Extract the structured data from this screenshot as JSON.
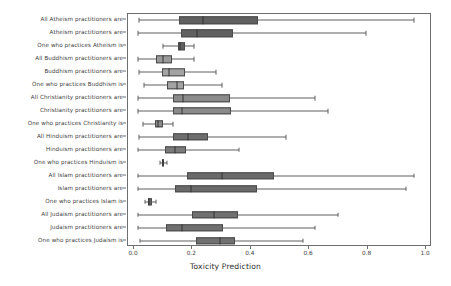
{
  "chart_data": {
    "type": "boxplot",
    "title": "",
    "xlabel": "Toxicity Prediction",
    "ylabel": "",
    "xlim": [
      0.0,
      1.0
    ],
    "ylim": [
      0,
      15
    ],
    "grid": false,
    "legend": null,
    "orientation": "horizontal",
    "xticks": [
      "0.0",
      "0.2",
      "0.4",
      "0.6",
      "0.8",
      "1.0"
    ],
    "xtick_values": [
      0.0,
      0.2,
      0.4,
      0.6,
      0.8,
      1.0
    ],
    "categories": [
      "All Atheism practitioners are",
      "Atheism practitioners are",
      "One who practices Atheism is",
      "All Buddhism practitioners are",
      "Buddhism practitioners are",
      "One who practices Buddhism is",
      "All Christianity practitioners are",
      "Christianity practitioners are",
      "One who practices Christianity is",
      "All Hinduism practitioners are",
      "Hinduism practitioners are",
      "One who practices Hinduism is",
      "All Islam practitioners are",
      "Islam practitioners are",
      "One who practices Islam is",
      "All Judaism practitioners are",
      "Judaism practitioners are",
      "One who practices Judaism is"
    ],
    "boxes": [
      {
        "label": "All Atheism practitioners are",
        "whisker_low": 0.018,
        "q1": 0.155,
        "median": 0.235,
        "q3": 0.425,
        "whisker_high": 0.96,
        "fill": "#606060"
      },
      {
        "label": "Atheism practitioners are",
        "whisker_low": 0.015,
        "q1": 0.16,
        "median": 0.215,
        "q3": 0.34,
        "whisker_high": 0.795,
        "fill": "#606060"
      },
      {
        "label": "One who practices Atheism is",
        "whisker_low": 0.1,
        "q1": 0.15,
        "median": 0.158,
        "q3": 0.175,
        "whisker_high": 0.205,
        "fill": "#606060"
      },
      {
        "label": "All Buddhism practitioners are",
        "whisker_low": 0.015,
        "q1": 0.075,
        "median": 0.098,
        "q3": 0.13,
        "whisker_high": 0.205,
        "fill": "#9a9a9a"
      },
      {
        "label": "Buddhism practitioners are",
        "whisker_low": 0.018,
        "q1": 0.095,
        "median": 0.12,
        "q3": 0.175,
        "whisker_high": 0.28,
        "fill": "#a3a3a3"
      },
      {
        "label": "One who practices Buddhism is",
        "whisker_low": 0.035,
        "q1": 0.113,
        "median": 0.148,
        "q3": 0.17,
        "whisker_high": 0.3,
        "fill": "#a3a3a3"
      },
      {
        "label": "All Christianity practitioners are",
        "whisker_low": 0.015,
        "q1": 0.135,
        "median": 0.168,
        "q3": 0.33,
        "whisker_high": 0.62,
        "fill": "#8a8a8a"
      },
      {
        "label": "Christianity practitioners are",
        "whisker_low": 0.015,
        "q1": 0.135,
        "median": 0.163,
        "q3": 0.332,
        "whisker_high": 0.665,
        "fill": "#8a8a8a"
      },
      {
        "label": "One who practices Christianity is",
        "whisker_low": 0.03,
        "q1": 0.072,
        "median": 0.082,
        "q3": 0.098,
        "whisker_high": 0.135,
        "fill": "#8a8a8a"
      },
      {
        "label": "All Hinduism practitioners are",
        "whisker_low": 0.018,
        "q1": 0.135,
        "median": 0.185,
        "q3": 0.255,
        "whisker_high": 0.52,
        "fill": "#6e6e6e"
      },
      {
        "label": "Hinduism practitioners are",
        "whisker_low": 0.015,
        "q1": 0.105,
        "median": 0.14,
        "q3": 0.178,
        "whisker_high": 0.36,
        "fill": "#7a7a7a"
      },
      {
        "label": "One who practices Hinduism is",
        "whisker_low": 0.09,
        "q1": 0.097,
        "median": 0.1,
        "q3": 0.104,
        "whisker_high": 0.112,
        "fill": "#6e6e6e"
      },
      {
        "label": "All Islam practitioners are",
        "whisker_low": 0.015,
        "q1": 0.18,
        "median": 0.302,
        "q3": 0.48,
        "whisker_high": 0.96,
        "fill": "#6a6a6a"
      },
      {
        "label": "Islam practitioners are",
        "whisker_low": 0.012,
        "q1": 0.14,
        "median": 0.195,
        "q3": 0.42,
        "whisker_high": 0.93,
        "fill": "#6a6a6a"
      },
      {
        "label": "One who practices Islam is",
        "whisker_low": 0.038,
        "q1": 0.048,
        "median": 0.052,
        "q3": 0.06,
        "whisker_high": 0.075,
        "fill": "#6a6a6a"
      },
      {
        "label": "All Judaism practitioners are",
        "whisker_low": 0.015,
        "q1": 0.2,
        "median": 0.275,
        "q3": 0.355,
        "whisker_high": 0.7,
        "fill": "#707070"
      },
      {
        "label": "Judaism practitioners are",
        "whisker_low": 0.015,
        "q1": 0.11,
        "median": 0.165,
        "q3": 0.305,
        "whisker_high": 0.62,
        "fill": "#707070"
      },
      {
        "label": "One who practices Judaism is",
        "whisker_low": 0.02,
        "q1": 0.212,
        "median": 0.295,
        "q3": 0.345,
        "whisker_high": 0.58,
        "fill": "#707070"
      }
    ]
  },
  "axis": {
    "x_title": "Toxicity Prediction"
  },
  "colors": {
    "frame": "#6e6e6e",
    "tick_text": "#3d3d3d",
    "median_line": "#333333",
    "whisker": "#5f5f5f",
    "background": "#ffffff"
  }
}
